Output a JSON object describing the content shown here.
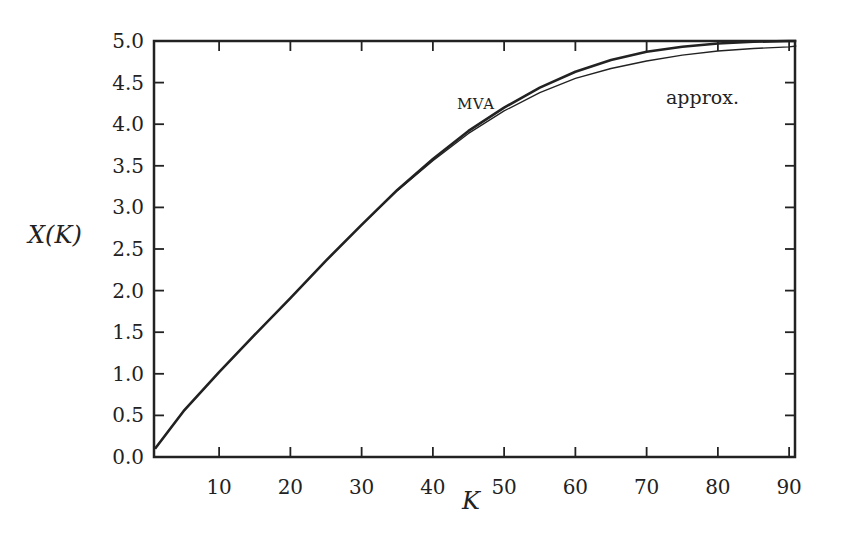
{
  "chart_data": {
    "type": "line",
    "title": "",
    "xlabel": "K",
    "ylabel": "X(K)",
    "xlim": [
      1,
      91
    ],
    "ylim": [
      0.0,
      5.0
    ],
    "grid": false,
    "legend": "inline annotations",
    "x_ticks": [
      10,
      20,
      30,
      40,
      50,
      60,
      70,
      80,
      90
    ],
    "y_ticks": [
      0.0,
      0.5,
      1.0,
      1.5,
      2.0,
      2.5,
      3.0,
      3.5,
      4.0,
      4.5,
      5.0
    ],
    "x": [
      1,
      5,
      10,
      15,
      20,
      25,
      30,
      35,
      40,
      45,
      50,
      55,
      60,
      65,
      70,
      75,
      80,
      85,
      90,
      91
    ],
    "series": [
      {
        "name": "MVA",
        "style": "thick",
        "values": [
          0.1,
          0.55,
          1.02,
          1.47,
          1.91,
          2.36,
          2.79,
          3.21,
          3.58,
          3.92,
          4.2,
          4.44,
          4.63,
          4.77,
          4.87,
          4.93,
          4.97,
          4.99,
          5.0,
          5.0
        ]
      },
      {
        "name": "approx.",
        "style": "thin",
        "values": [
          0.1,
          0.55,
          1.02,
          1.47,
          1.91,
          2.36,
          2.79,
          3.2,
          3.56,
          3.89,
          4.16,
          4.38,
          4.55,
          4.67,
          4.76,
          4.83,
          4.88,
          4.91,
          4.93,
          4.94
        ]
      }
    ],
    "annotations": [
      {
        "text": "MVA",
        "x": 46,
        "y": 4.55
      },
      {
        "text": "approx.",
        "x": 79,
        "y": 4.5
      }
    ]
  },
  "labels": {
    "xlabel": "K",
    "ylabel": "X(K)",
    "mva": "MVA",
    "approx": "approx."
  }
}
